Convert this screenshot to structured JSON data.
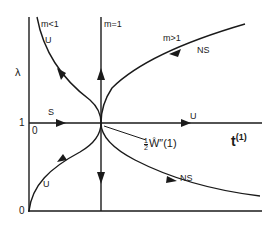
{
  "diagram": {
    "type": "phase-diagram",
    "axes": {
      "y_label": "λ",
      "x_label": "t",
      "x_label_superscript": "(1)",
      "y_tick_0": "0",
      "y_tick_1": "1",
      "origin_on_line_1": "0"
    },
    "curves": {
      "m_less_1": {
        "label": "m<1",
        "stability": "U"
      },
      "m_equal_1": {
        "label": "m=1"
      },
      "m_greater_1": {
        "label": "m>1",
        "stability": "NS"
      },
      "lower_left": {
        "stability": "U"
      },
      "lower_right": {
        "stability": "NS"
      },
      "horizontal_left": {
        "stability": "S"
      },
      "horizontal_right": {
        "stability": "U"
      }
    },
    "annotation": {
      "coefficient_num": "1",
      "coefficient_den": "2",
      "symbol": "Ŵ″(1)"
    },
    "colors": {
      "ink": "#1a1a1a",
      "background": "#ffffff"
    }
  }
}
